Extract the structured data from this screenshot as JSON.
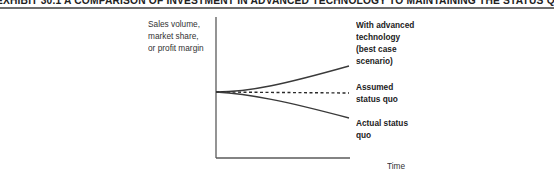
{
  "exhibit": {
    "title": "EXHIBIT 30.1   A COMPARISON OF INVESTMENT IN ADVANCED TECHNOLOGY TO MAINTAINING THE STATUS QUO"
  },
  "axes": {
    "y_label_lines": [
      "Sales volume,",
      "market share,",
      "or profit margin"
    ],
    "x_label": "Time"
  },
  "curves": [
    {
      "id": "advanced",
      "label_lines": [
        "With advanced",
        "technology",
        "(best case",
        "scenario)"
      ],
      "style": "solid",
      "direction": "up"
    },
    {
      "id": "assumed",
      "label_lines": [
        "Assumed",
        "status quo"
      ],
      "style": "dashed",
      "direction": "flat"
    },
    {
      "id": "actual",
      "label_lines": [
        "Actual status",
        "quo"
      ],
      "style": "solid",
      "direction": "down"
    }
  ],
  "colors": {
    "line": "#3a3a3a",
    "axis": "#5a5a5a",
    "rule": "#6e6e6e"
  }
}
